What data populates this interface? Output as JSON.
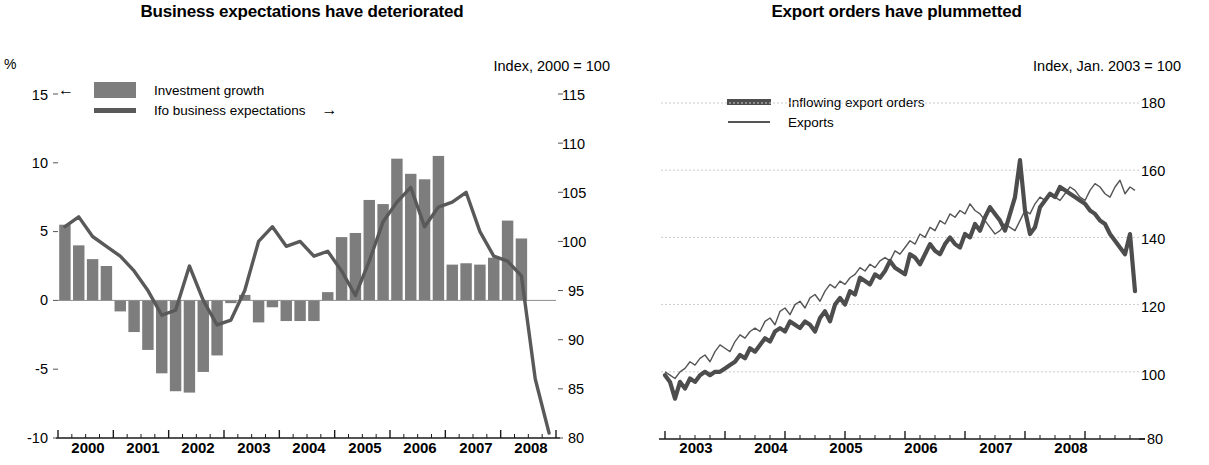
{
  "figure": {
    "background": "#ffffff",
    "bar_color": "#7d7d7d",
    "line_color": "#595959",
    "thick_line_color": "#4d4d4d",
    "thin_line_color": "#555555",
    "grid_color": "#cccccc"
  },
  "panels": [
    {
      "id": "business-expectations",
      "title": "Business expectations have deteriorated",
      "left_unit": "%",
      "right_unit": "Index, 2000 = 100",
      "legend": [
        {
          "label": "Investment growth",
          "marker": "bar-swatch",
          "arrow": "←",
          "arrow_side": "left"
        },
        {
          "label": "Ifo business expectations",
          "marker": "line-swatch",
          "arrow": "→",
          "arrow_side": "right"
        }
      ],
      "left_ticks": [
        "15",
        "10",
        "5",
        "0",
        "-5",
        "-10"
      ],
      "right_ticks": [
        "115",
        "110",
        "105",
        "100",
        "95",
        "90",
        "85",
        "80"
      ],
      "x_ticks": [
        "2000",
        "2001",
        "2002",
        "2003",
        "2004",
        "2005",
        "2006",
        "2007",
        "2008"
      ]
    },
    {
      "id": "export-orders",
      "title": "Export orders have plummetted",
      "right_unit": "Index, Jan. 2003 = 100",
      "legend": [
        {
          "label": "Inflowing export orders",
          "marker": "thick-line-swatch"
        },
        {
          "label": "Exports",
          "marker": "thin-line-swatch"
        }
      ],
      "right_ticks": [
        "180",
        "160",
        "140",
        "120",
        "100",
        "80"
      ],
      "x_ticks": [
        "2003",
        "2004",
        "2005",
        "2006",
        "2007",
        "2008"
      ]
    }
  ],
  "chart_data": [
    {
      "type": "bar",
      "id": "business-expectations",
      "title": "Business expectations have deteriorated",
      "xlabel": "",
      "ylabel": "%",
      "y2label": "Index, 2000 = 100",
      "ylim": [
        -10,
        15
      ],
      "y2lim": [
        80,
        115
      ],
      "yticks": [
        -10,
        -5,
        0,
        5,
        10,
        15
      ],
      "y2ticks": [
        80,
        85,
        90,
        95,
        100,
        105,
        110,
        115
      ],
      "grid": false,
      "legend_position": "top-left",
      "x_axis_type": "quarterly",
      "x_start": "2000Q1",
      "x_end": "2008Q4",
      "x_tick_labels": [
        "2000",
        "2001",
        "2002",
        "2003",
        "2004",
        "2005",
        "2006",
        "2007",
        "2008"
      ],
      "series": [
        {
          "name": "Investment growth",
          "type": "bar",
          "axis": "left",
          "unit": "%",
          "x": [
            "2000Q1",
            "2000Q2",
            "2000Q3",
            "2000Q4",
            "2001Q1",
            "2001Q2",
            "2001Q3",
            "2001Q4",
            "2002Q1",
            "2002Q2",
            "2002Q3",
            "2002Q4",
            "2003Q1",
            "2003Q2",
            "2003Q3",
            "2003Q4",
            "2004Q1",
            "2004Q2",
            "2004Q3",
            "2004Q4",
            "2005Q1",
            "2005Q2",
            "2005Q3",
            "2005Q4",
            "2006Q1",
            "2006Q2",
            "2006Q3",
            "2006Q4",
            "2007Q1",
            "2007Q2",
            "2007Q3",
            "2007Q4",
            "2008Q1",
            "2008Q2"
          ],
          "values": [
            5.5,
            4.0,
            3.0,
            2.5,
            -0.8,
            -2.3,
            -3.6,
            -5.3,
            -6.6,
            -6.7,
            -5.2,
            -4.0,
            -0.2,
            0.4,
            -1.6,
            -0.5,
            -1.5,
            -1.5,
            -1.5,
            0.6,
            4.6,
            4.9,
            7.3,
            7.0,
            10.3,
            9.2,
            8.8,
            10.5,
            2.6,
            2.7,
            2.6,
            3.1,
            5.8,
            4.5
          ]
        },
        {
          "name": "Ifo business expectations",
          "type": "line",
          "axis": "right",
          "unit": "Index, 2000 = 100",
          "x": [
            "2000Q1",
            "2000Q2",
            "2000Q3",
            "2000Q4",
            "2001Q1",
            "2001Q2",
            "2001Q3",
            "2001Q4",
            "2002Q1",
            "2002Q2",
            "2002Q3",
            "2002Q4",
            "2003Q1",
            "2003Q2",
            "2003Q3",
            "2003Q4",
            "2004Q1",
            "2004Q2",
            "2004Q3",
            "2004Q4",
            "2005Q1",
            "2005Q2",
            "2005Q3",
            "2005Q4",
            "2006Q1",
            "2006Q2",
            "2006Q3",
            "2006Q4",
            "2007Q1",
            "2007Q2",
            "2007Q3",
            "2007Q4",
            "2008Q1",
            "2008Q2",
            "2008Q3",
            "2008Q4"
          ],
          "values": [
            101.5,
            102.5,
            100.5,
            99.5,
            98.5,
            97.0,
            95.0,
            92.5,
            93.0,
            97.5,
            94.0,
            91.5,
            92.0,
            95.0,
            100.0,
            101.5,
            99.5,
            100.0,
            98.5,
            99.0,
            97.0,
            94.5,
            98.0,
            102.0,
            104.0,
            105.5,
            101.5,
            103.5,
            104.0,
            105.0,
            101.0,
            98.5,
            98.0,
            96.5,
            86.0,
            80.5
          ]
        }
      ]
    },
    {
      "type": "line",
      "id": "export-orders",
      "title": "Export orders have plummetted",
      "xlabel": "",
      "ylabel": "",
      "y2label": "Index, Jan. 2003 = 100",
      "ylim": [
        80,
        180
      ],
      "yticks": [
        80,
        100,
        120,
        140,
        160,
        180
      ],
      "grid": true,
      "grid_axis": "y",
      "legend_position": "top-left",
      "x_axis_type": "monthly",
      "x_start": "2003-01",
      "x_end": "2008-10",
      "x_tick_labels": [
        "2003",
        "2004",
        "2005",
        "2006",
        "2007",
        "2008"
      ],
      "series": [
        {
          "name": "Inflowing export orders",
          "style": "thick",
          "values": [
            99,
            97,
            92,
            97,
            95,
            98,
            97,
            99,
            100,
            99,
            100,
            100,
            101,
            102,
            103,
            105,
            104,
            107,
            106,
            108,
            110,
            109,
            112,
            113,
            112,
            115,
            114,
            113,
            115,
            114,
            112,
            116,
            118,
            115,
            120,
            122,
            120,
            124,
            123,
            128,
            127,
            126,
            129,
            128,
            130,
            133,
            131,
            130,
            129,
            135,
            134,
            132,
            135,
            138,
            136,
            135,
            138,
            140,
            138,
            137,
            141,
            140,
            144,
            142,
            146,
            149,
            147,
            145,
            142,
            147,
            152,
            163,
            148,
            141,
            143,
            149,
            151,
            153,
            152,
            155,
            154,
            153,
            152,
            151,
            150,
            148,
            147,
            145,
            144,
            141,
            139,
            137,
            135,
            141,
            124
          ]
        },
        {
          "name": "Exports",
          "style": "thin",
          "values": [
            100,
            99,
            98,
            100,
            101,
            103,
            102,
            104,
            105,
            103,
            106,
            108,
            107,
            106,
            109,
            111,
            110,
            112,
            113,
            112,
            115,
            116,
            114,
            118,
            119,
            117,
            120,
            121,
            119,
            122,
            123,
            121,
            124,
            126,
            125,
            127,
            126,
            128,
            129,
            131,
            130,
            132,
            131,
            133,
            134,
            133,
            136,
            135,
            137,
            139,
            138,
            141,
            140,
            143,
            142,
            145,
            144,
            147,
            146,
            148,
            147,
            150,
            148,
            147,
            145,
            143,
            141,
            142,
            144,
            143,
            142,
            145,
            148,
            147,
            150,
            152,
            151,
            153,
            152,
            151,
            153,
            155,
            154,
            152,
            151,
            154,
            156,
            155,
            153,
            152,
            155,
            157,
            153,
            155,
            154
          ]
        }
      ]
    }
  ]
}
